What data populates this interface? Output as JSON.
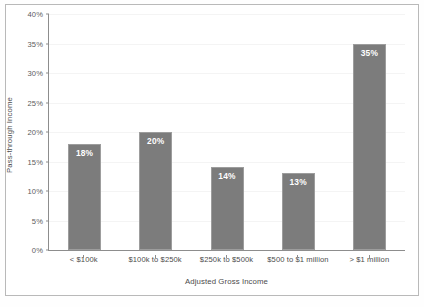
{
  "chart_data": {
    "type": "bar",
    "title": "",
    "subtitle": "",
    "xlabel": "Adjusted Gross Income",
    "ylabel": "Pass-through Income",
    "categories": [
      "< $100k",
      "$100k to $250k",
      "$250k to $500k",
      "$500 to $1 million",
      "> $1 million"
    ],
    "values": [
      18,
      20,
      14,
      13,
      35
    ],
    "data_labels": [
      "18%",
      "20%",
      "14%",
      "13%",
      "35%"
    ],
    "ylim": [
      0,
      40
    ],
    "ytick_values": [
      40,
      35,
      30,
      25,
      20,
      15,
      10,
      5,
      0
    ],
    "ytick_labels": [
      "40%",
      "35%",
      "30%",
      "25%",
      "20%",
      "15%",
      "10%",
      "5%",
      "0%"
    ],
    "grid": true,
    "legend": false,
    "legend_position": "none",
    "bar_color": "#7c7c7c",
    "bar_border_color": "#9d9d9d",
    "data_label_color": "#ffffff",
    "axis_color": "#8d8d8d",
    "frame_color": "#b9b9b9",
    "text_color": "#4c4c4c"
  }
}
